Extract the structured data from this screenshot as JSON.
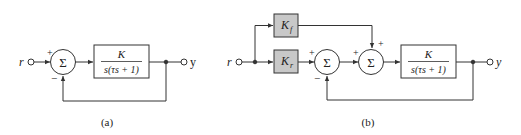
{
  "diagram_a": {
    "caption": "(a)",
    "input_label": "r",
    "output_label": "y",
    "sum_symbol": "Σ",
    "sum_signs": {
      "top": "+",
      "bottom": "−"
    },
    "plant": {
      "numerator": "K",
      "denominator": "s(τs + 1)"
    }
  },
  "diagram_b": {
    "caption": "(b)",
    "input_label": "r",
    "output_label": "y",
    "feedforward_gain": {
      "symbol": "K",
      "subscript": "f"
    },
    "reference_gain": {
      "symbol": "K",
      "subscript": "r"
    },
    "sum1": {
      "symbol": "Σ",
      "signs": {
        "left": "+",
        "bottom": "−"
      }
    },
    "sum2": {
      "symbol": "Σ",
      "signs": {
        "left": "+",
        "top": "+"
      }
    },
    "plant": {
      "numerator": "K",
      "denominator": "s(τs + 1)"
    }
  },
  "colors": {
    "line": "#333333",
    "gain_fill": "#c8c8c8",
    "background": "#ffffff"
  }
}
